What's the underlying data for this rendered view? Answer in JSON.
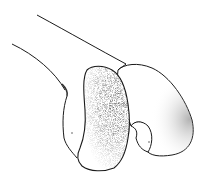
{
  "image": {
    "kind": "line-art illustration",
    "subject": "distal end of a long bone with condyles",
    "background_color": "#ffffff",
    "line_color": "#1a1a1a",
    "stipple_color": "#555555"
  }
}
